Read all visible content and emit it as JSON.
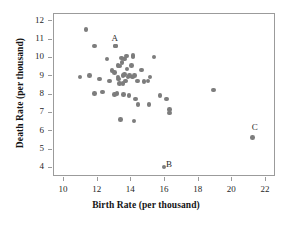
{
  "chart_data": {
    "type": "scatter",
    "title": "",
    "xlabel": "Birth Rate (per thousand)",
    "ylabel": "Death Rate (per thousand)",
    "xlim": [
      9.4,
      22.6
    ],
    "ylim": [
      3.5,
      12.4
    ],
    "xticks": [
      10,
      12,
      14,
      16,
      18,
      20,
      22
    ],
    "yticks": [
      4,
      5,
      6,
      7,
      8,
      9,
      10,
      11,
      12
    ],
    "grid": false,
    "legend": null,
    "marker_color": "#7d7d7d",
    "frame_color": "#9b9b9b",
    "points": [
      {
        "x": 10.95,
        "y": 8.95
      },
      {
        "x": 11.3,
        "y": 11.55
      },
      {
        "x": 11.5,
        "y": 9.05
      },
      {
        "x": 11.8,
        "y": 10.65
      },
      {
        "x": 11.8,
        "y": 8.05
      },
      {
        "x": 12.1,
        "y": 8.85
      },
      {
        "x": 12.3,
        "y": 8.15
      },
      {
        "x": 12.55,
        "y": 9.95
      },
      {
        "x": 12.7,
        "y": 8.75
      },
      {
        "x": 12.85,
        "y": 9.3
      },
      {
        "x": 13.0,
        "y": 9.2
      },
      {
        "x": 13.05,
        "y": 10.65
      },
      {
        "x": 13.0,
        "y": 8.0
      },
      {
        "x": 13.15,
        "y": 8.05
      },
      {
        "x": 13.2,
        "y": 9.6
      },
      {
        "x": 13.2,
        "y": 8.95
      },
      {
        "x": 13.25,
        "y": 8.85
      },
      {
        "x": 13.3,
        "y": 9.55
      },
      {
        "x": 13.3,
        "y": 8.6
      },
      {
        "x": 13.35,
        "y": 6.65
      },
      {
        "x": 13.4,
        "y": 10.0
      },
      {
        "x": 13.45,
        "y": 9.75
      },
      {
        "x": 13.5,
        "y": 9.05
      },
      {
        "x": 13.5,
        "y": 8.6
      },
      {
        "x": 13.55,
        "y": 8.0
      },
      {
        "x": 13.6,
        "y": 9.95
      },
      {
        "x": 13.6,
        "y": 9.1
      },
      {
        "x": 13.65,
        "y": 8.75
      },
      {
        "x": 13.7,
        "y": 10.1
      },
      {
        "x": 13.75,
        "y": 9.4
      },
      {
        "x": 13.8,
        "y": 8.95
      },
      {
        "x": 13.85,
        "y": 7.95
      },
      {
        "x": 13.9,
        "y": 9.05
      },
      {
        "x": 14.0,
        "y": 9.6
      },
      {
        "x": 14.05,
        "y": 8.95
      },
      {
        "x": 14.1,
        "y": 10.15
      },
      {
        "x": 14.1,
        "y": 10.05
      },
      {
        "x": 14.15,
        "y": 6.55
      },
      {
        "x": 14.2,
        "y": 9.05
      },
      {
        "x": 14.25,
        "y": 7.75
      },
      {
        "x": 14.35,
        "y": 8.75
      },
      {
        "x": 14.4,
        "y": 7.45
      },
      {
        "x": 14.6,
        "y": 9.35
      },
      {
        "x": 14.75,
        "y": 8.7
      },
      {
        "x": 15.0,
        "y": 8.75
      },
      {
        "x": 15.05,
        "y": 7.45
      },
      {
        "x": 15.1,
        "y": 8.95
      },
      {
        "x": 15.35,
        "y": 10.05
      },
      {
        "x": 15.7,
        "y": 7.95
      },
      {
        "x": 16.1,
        "y": 7.75
      },
      {
        "x": 16.25,
        "y": 7.2
      },
      {
        "x": 16.25,
        "y": 7.0
      },
      {
        "x": 18.9,
        "y": 8.25
      },
      {
        "x": 13.05,
        "y": 10.65,
        "label": "A",
        "label_pos": "above"
      },
      {
        "x": 15.95,
        "y": 4.05,
        "label": "B",
        "label_pos": "right"
      },
      {
        "x": 21.2,
        "y": 5.65,
        "label": "C",
        "label_pos": "above-right"
      }
    ],
    "annotations": [
      {
        "text": "A",
        "x": 13.05,
        "y": 11.0
      },
      {
        "text": "B",
        "x": 16.3,
        "y": 4.1
      },
      {
        "text": "C",
        "x": 21.4,
        "y": 6.1
      }
    ]
  }
}
